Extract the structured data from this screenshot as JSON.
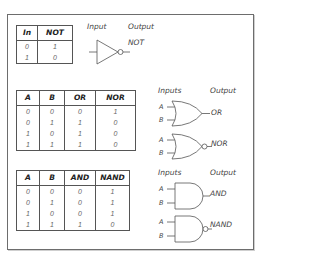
{
  "not_section": {
    "table": {
      "headers": [
        "In",
        "NOT"
      ],
      "rows": [
        [
          "0",
          "1"
        ],
        [
          "1",
          "0"
        ]
      ]
    },
    "gate": {
      "type": "NOT",
      "input_label": "Input",
      "output_label": "Output",
      "output_name": "NOT"
    }
  },
  "or_section": {
    "table": {
      "headers": [
        "A",
        "B",
        "OR",
        "NOR"
      ],
      "rows": [
        [
          "0",
          "0",
          "0",
          "1"
        ],
        [
          "0",
          "1",
          "1",
          "0"
        ],
        [
          "1",
          "0",
          "1",
          "0"
        ],
        [
          "1",
          "1",
          "1",
          "0"
        ]
      ]
    },
    "inputs_label": "Inputs",
    "output_label": "Output",
    "gates": [
      {
        "type": "OR",
        "input_a": "A",
        "input_b": "B",
        "output_name": "OR"
      },
      {
        "type": "NOR",
        "input_a": "A",
        "input_b": "B",
        "output_name": "NOR"
      }
    ]
  },
  "and_section": {
    "table": {
      "headers": [
        "A",
        "B",
        "AND",
        "NAND"
      ],
      "rows": [
        [
          "0",
          "0",
          "0",
          "1"
        ],
        [
          "0",
          "1",
          "0",
          "1"
        ],
        [
          "1",
          "0",
          "0",
          "1"
        ],
        [
          "1",
          "1",
          "1",
          "0"
        ]
      ]
    },
    "inputs_label": "Inputs",
    "output_label": "Output",
    "gates": [
      {
        "type": "AND",
        "input_a": "A",
        "input_b": "B",
        "output_name": "AND"
      },
      {
        "type": "NAND",
        "input_a": "A",
        "input_b": "B",
        "output_name": "NAND"
      }
    ]
  },
  "colors": {
    "line": "#555555",
    "frame": "#6d6d6d",
    "text": "#222222",
    "value_text": "#666666"
  }
}
